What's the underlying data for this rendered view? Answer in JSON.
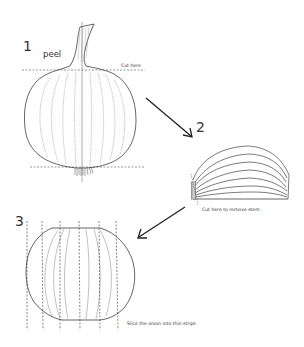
{
  "diagram": {
    "type": "instructional-illustration",
    "colors": {
      "line": "#222222",
      "dashed": "#333333",
      "background": "#ffffff"
    },
    "steps": [
      {
        "number": "1",
        "label": "peel",
        "annotations": [
          "Cut here"
        ]
      },
      {
        "number": "2",
        "annotations": [
          "Cut here to remove stem"
        ]
      },
      {
        "number": "3",
        "annotations": [
          "Slice the onion into thin strips"
        ]
      }
    ],
    "arrows": [
      {
        "from": "step-1",
        "to": "step-2"
      },
      {
        "from": "step-2",
        "to": "step-3"
      }
    ]
  }
}
